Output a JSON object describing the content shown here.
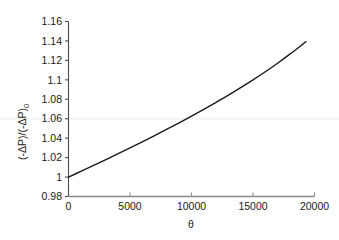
{
  "chart_data": {
    "type": "line",
    "title": "",
    "xlabel": "θ",
    "ylabel": "(-ΔP)/(-ΔP)₀",
    "ylabel_parts": {
      "main": "(-ΔP)/(-ΔP)",
      "subscript": "0"
    },
    "xlim": [
      0,
      20000
    ],
    "ylim": [
      0.98,
      1.16
    ],
    "xticks": [
      0,
      5000,
      10000,
      15000,
      20000
    ],
    "yticks": [
      0.98,
      1,
      1.02,
      1.04,
      1.06,
      1.08,
      1.1,
      1.12,
      1.14,
      1.16
    ],
    "xtick_labels": [
      "0",
      "5000",
      "10000",
      "15000",
      "20000"
    ],
    "ytick_labels": [
      "0.98",
      "1",
      "1.02",
      "1.04",
      "1.06",
      "1.08",
      "1.1",
      "1.12",
      "1.14",
      "1.16"
    ],
    "grid": false,
    "faint_gridline_y": 1.06,
    "legend": null,
    "series": [
      {
        "name": "pressure-drop-ratio",
        "color": "#1a1a1a",
        "line_width": 1.4,
        "x": [
          0,
          1000,
          2000,
          3000,
          4000,
          5000,
          6000,
          7000,
          8000,
          9000,
          10000,
          11000,
          12000,
          13000,
          14000,
          15000,
          16000,
          17000,
          18000,
          19000,
          19300
        ],
        "y": [
          1.0,
          1.0058,
          1.0117,
          1.0177,
          1.0238,
          1.03,
          1.0363,
          1.0427,
          1.0492,
          1.0558,
          1.0626,
          1.0696,
          1.0768,
          1.0842,
          1.0919,
          1.0999,
          1.1083,
          1.1171,
          1.1264,
          1.1362,
          1.1393
        ]
      }
    ]
  },
  "axes_style": {
    "y_axis_color": "#4d4d4d",
    "x_axis_color": "#8c8c8c",
    "tick_color": "#4d4d4d",
    "curve_color": "#1a1a1a",
    "background": "#ffffff"
  }
}
